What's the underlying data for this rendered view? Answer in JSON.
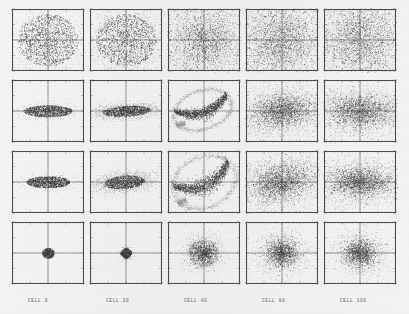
{
  "figure": {
    "type": "scatter-plot-grid",
    "rows": 4,
    "columns": 5,
    "background_color": "#f2f2f0",
    "ink_color": "#2b2b2b",
    "frame_color": "#4a4a4a"
  },
  "column_labels": [
    {
      "text": "CELL   0",
      "cell": 0
    },
    {
      "text": "CELL  20",
      "cell": 20
    },
    {
      "text": "CELL  40",
      "cell": 40
    },
    {
      "text": "CELL  80",
      "cell": 80
    },
    {
      "text": "CELL 100",
      "cell": 100
    }
  ],
  "chart_data": {
    "type": "scatter",
    "title": "",
    "xlabel": "",
    "ylabel": "",
    "xlim": [
      -10,
      10
    ],
    "ylim": [
      -10,
      10
    ],
    "grid": false,
    "axes_style": "box-with-ticks-and-crosshair",
    "tick_labels_x": [
      "-10",
      "-5",
      "0",
      "5",
      "10"
    ],
    "tick_labels_y": [
      "-10",
      "-5",
      "0",
      "5",
      "10"
    ],
    "columns": [
      0,
      20,
      40,
      80,
      100
    ],
    "row_descriptions": [
      "round core distribution",
      "horizontally elongated distribution",
      "horizontally elongated distribution",
      "compact round core distribution"
    ],
    "panels": [
      {
        "row": 0,
        "col": 0,
        "cell": 0,
        "shape": "disk",
        "rx": 0.42,
        "ry": 0.42,
        "halo": 0.02,
        "n": 1500,
        "density": "uniform-dense",
        "tilt": 0,
        "cx": 0.0,
        "cy": 0.0
      },
      {
        "row": 0,
        "col": 1,
        "cell": 20,
        "shape": "disk",
        "rx": 0.42,
        "ry": 0.42,
        "halo": 0.05,
        "n": 1500,
        "density": "uniform-dense",
        "tilt": 0,
        "cx": 0.0,
        "cy": 0.0
      },
      {
        "row": 0,
        "col": 2,
        "cell": 40,
        "shape": "cloud",
        "rx": 0.44,
        "ry": 0.47,
        "halo": 0.22,
        "n": 1700,
        "density": "core-plus-scatter",
        "tilt": 0,
        "cx": 0.0,
        "cy": 0.0
      },
      {
        "row": 0,
        "col": 3,
        "cell": 80,
        "shape": "cloud",
        "rx": 0.5,
        "ry": 0.52,
        "halo": 0.34,
        "n": 1900,
        "density": "diffuse",
        "tilt": 0,
        "cx": 0.0,
        "cy": 0.0
      },
      {
        "row": 0,
        "col": 4,
        "cell": 100,
        "shape": "cloud",
        "rx": 0.52,
        "ry": 0.52,
        "halo": 0.36,
        "n": 1900,
        "density": "diffuse",
        "tilt": 0,
        "cx": 0.0,
        "cy": 0.0
      },
      {
        "row": 1,
        "col": 0,
        "cell": 0,
        "shape": "ellipse",
        "rx": 0.34,
        "ry": 0.095,
        "halo": 0.01,
        "n": 1300,
        "density": "uniform-dense",
        "tilt": 0,
        "cx": 0.0,
        "cy": 0.0
      },
      {
        "row": 1,
        "col": 1,
        "cell": 20,
        "shape": "ellipse",
        "rx": 0.34,
        "ry": 0.085,
        "halo": 0.05,
        "n": 1300,
        "density": "uniform-dense",
        "tilt": -3,
        "cx": 0.0,
        "cy": 0.0
      },
      {
        "row": 1,
        "col": 2,
        "cell": 40,
        "shape": "filament",
        "rx": 0.36,
        "ry": 0.2,
        "halo": 0.16,
        "n": 1500,
        "density": "swept-tail",
        "tilt": -18,
        "cx": -0.02,
        "cy": 0.02
      },
      {
        "row": 1,
        "col": 3,
        "cell": 80,
        "shape": "cloud",
        "rx": 0.42,
        "ry": 0.24,
        "halo": 0.22,
        "n": 1800,
        "density": "diffuse",
        "tilt": -6,
        "cx": 0.0,
        "cy": 0.0
      },
      {
        "row": 1,
        "col": 4,
        "cell": 100,
        "shape": "cloud",
        "rx": 0.44,
        "ry": 0.25,
        "halo": 0.24,
        "n": 1800,
        "density": "diffuse",
        "tilt": 0,
        "cx": 0.0,
        "cy": 0.0
      },
      {
        "row": 2,
        "col": 0,
        "cell": 0,
        "shape": "ellipse",
        "rx": 0.3,
        "ry": 0.095,
        "halo": 0.01,
        "n": 1300,
        "density": "uniform-dense",
        "tilt": 0,
        "cx": 0.0,
        "cy": 0.0
      },
      {
        "row": 2,
        "col": 1,
        "cell": 20,
        "shape": "ellipse",
        "rx": 0.28,
        "ry": 0.105,
        "halo": 0.06,
        "n": 1300,
        "density": "uniform-dense",
        "tilt": -5,
        "cx": -0.02,
        "cy": 0.0
      },
      {
        "row": 2,
        "col": 2,
        "cell": 40,
        "shape": "filament",
        "rx": 0.4,
        "ry": 0.26,
        "halo": 0.18,
        "n": 1600,
        "density": "s-curve",
        "tilt": -24,
        "cx": 0.0,
        "cy": 0.0
      },
      {
        "row": 2,
        "col": 3,
        "cell": 80,
        "shape": "cloud",
        "rx": 0.4,
        "ry": 0.26,
        "halo": 0.24,
        "n": 1800,
        "density": "diffuse",
        "tilt": -10,
        "cx": -0.02,
        "cy": 0.0
      },
      {
        "row": 2,
        "col": 4,
        "cell": 100,
        "shape": "cloud",
        "rx": 0.42,
        "ry": 0.22,
        "halo": 0.24,
        "n": 1800,
        "density": "diffuse",
        "tilt": 0,
        "cx": 0.0,
        "cy": 0.0
      },
      {
        "row": 3,
        "col": 0,
        "cell": 0,
        "shape": "disk",
        "rx": 0.085,
        "ry": 0.085,
        "halo": 0.0,
        "n": 600,
        "density": "solid",
        "tilt": 0,
        "cx": 0.0,
        "cy": 0.0
      },
      {
        "row": 3,
        "col": 1,
        "cell": 20,
        "shape": "diamond",
        "rx": 0.085,
        "ry": 0.095,
        "halo": 0.01,
        "n": 600,
        "density": "solid",
        "tilt": 0,
        "cx": 0.0,
        "cy": 0.0
      },
      {
        "row": 3,
        "col": 2,
        "cell": 40,
        "shape": "cloud",
        "rx": 0.16,
        "ry": 0.17,
        "halo": 0.1,
        "n": 1100,
        "density": "core-plus-ring",
        "tilt": 0,
        "cx": -0.01,
        "cy": 0.0
      },
      {
        "row": 3,
        "col": 3,
        "cell": 80,
        "shape": "cloud",
        "rx": 0.2,
        "ry": 0.2,
        "halo": 0.16,
        "n": 1300,
        "density": "diffuse",
        "tilt": 0,
        "cx": 0.0,
        "cy": 0.0
      },
      {
        "row": 3,
        "col": 4,
        "cell": 100,
        "shape": "cloud",
        "rx": 0.21,
        "ry": 0.21,
        "halo": 0.16,
        "n": 1300,
        "density": "diffuse",
        "tilt": 0,
        "cx": 0.0,
        "cy": 0.0
      }
    ]
  },
  "layout": {
    "panel_width": 72,
    "panel_height": 62,
    "col_x": [
      12,
      90,
      168,
      246,
      324
    ],
    "row_y": [
      9,
      80,
      151,
      222
    ],
    "label_y": 297,
    "label_x": [
      28,
      106,
      184,
      262,
      340
    ]
  }
}
